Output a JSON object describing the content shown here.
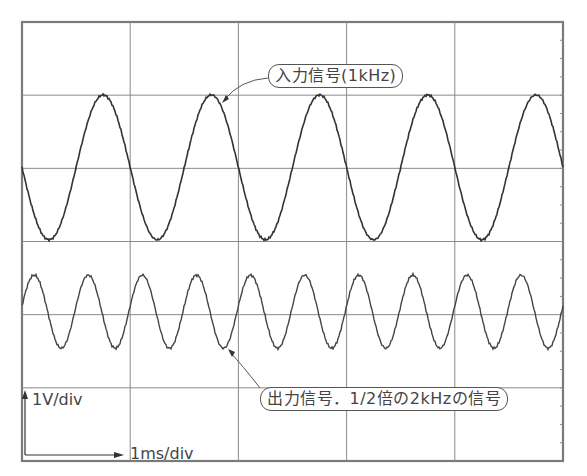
{
  "chart_data": {
    "type": "line",
    "title": "",
    "grid": {
      "x_divisions": 5,
      "y_divisions": 6,
      "on": true
    },
    "xlabel": "1ms/div",
    "ylabel": "1V/div",
    "x_unit_per_div": "1 ms",
    "y_unit_per_div": "1 V",
    "xlim_ms": [
      0,
      5
    ],
    "series": [
      {
        "name": "入力信号(1kHz)",
        "frequency_hz": 1000,
        "amplitude_v": 1.0,
        "period_ms": 1.0,
        "center_div_from_top": 2,
        "phase": "starts at zero crossing, descending",
        "color": "#333333"
      },
      {
        "name": "出力信号．1/2倍の2kHzの信号",
        "frequency_hz": 2000,
        "amplitude_v": 0.5,
        "period_ms": 0.5,
        "center_div_from_top": 4,
        "phase": "starts slightly above center, rising to peak",
        "color": "#444444"
      }
    ],
    "annotations": [
      {
        "text": "入力信号(1kHz)",
        "target": "input sine peak near x=1.75ms"
      },
      {
        "text": "出力信号．1/2倍の2kHzの信号",
        "target": "output sine trough near x=1.85ms"
      }
    ]
  },
  "labels": {
    "input_callout": "入力信号(1kHz)",
    "output_callout": "出力信号．1/2倍の2kHzの信号",
    "volts_per_div": "1V/div",
    "time_per_div": "1ms/div"
  },
  "colors": {
    "grid": "#8a8a8a",
    "frame": "#7a7a7a",
    "trace": "#333333",
    "text": "#444444"
  }
}
